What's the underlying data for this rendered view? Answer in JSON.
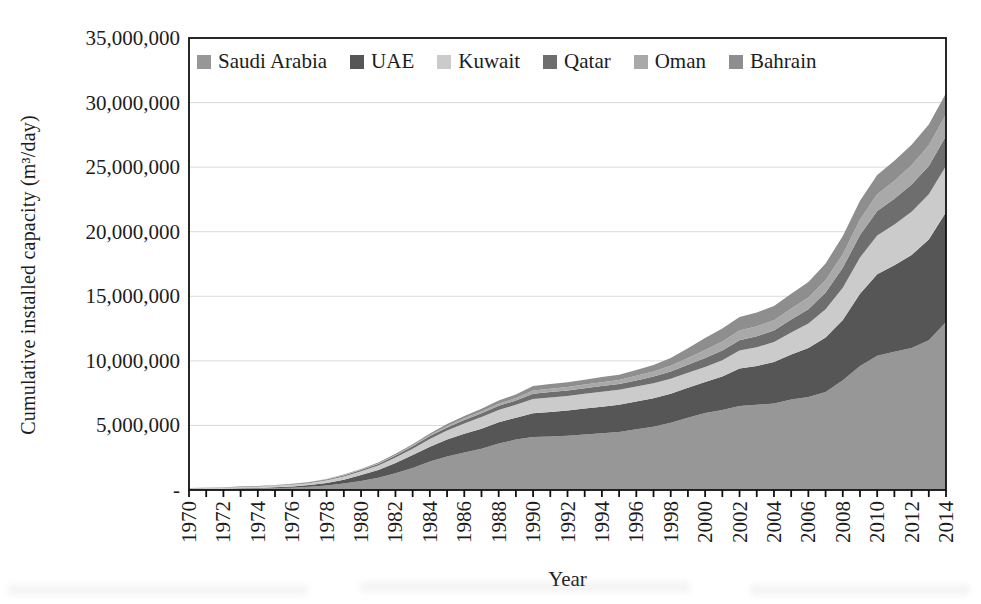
{
  "figure": {
    "y_axis_title": "Cumulative installed capacity (m³/day)",
    "x_axis_title": "Year"
  },
  "chart_data": {
    "type": "area",
    "stacked": true,
    "title": "",
    "xlabel": "Year",
    "ylabel": "Cumulative installed capacity (m³/day)",
    "legend_position": "top-inside-horizontal",
    "grid": "horizontal-only",
    "grid_color": "#dadada",
    "axis_color": "#111111",
    "text_color": "#1c1c1c",
    "ylim": [
      0,
      35000000
    ],
    "y_ticks": [
      {
        "value": 0,
        "label": "-"
      },
      {
        "value": 5000000,
        "label": "5,000,000"
      },
      {
        "value": 10000000,
        "label": "10,000,000"
      },
      {
        "value": 15000000,
        "label": "15,000,000"
      },
      {
        "value": 20000000,
        "label": "20,000,000"
      },
      {
        "value": 25000000,
        "label": "25,000,000"
      },
      {
        "value": 30000000,
        "label": "30,000,000"
      },
      {
        "value": 35000000,
        "label": "35,000,000"
      }
    ],
    "x_range": [
      1970,
      2014
    ],
    "x_minor_tick_every": 1,
    "x_label_every": 2,
    "x": [
      1970,
      1971,
      1972,
      1973,
      1974,
      1975,
      1976,
      1977,
      1978,
      1979,
      1980,
      1981,
      1982,
      1983,
      1984,
      1985,
      1986,
      1987,
      1988,
      1989,
      1990,
      1991,
      1992,
      1993,
      1994,
      1995,
      1996,
      1997,
      1998,
      1999,
      2000,
      2001,
      2002,
      2003,
      2004,
      2005,
      2006,
      2007,
      2008,
      2009,
      2010,
      2011,
      2012,
      2013,
      2014
    ],
    "series": [
      {
        "name": "Saudi Arabia",
        "color": "#979797",
        "values": [
          50000,
          60000,
          80000,
          100000,
          120000,
          150000,
          180000,
          250000,
          350000,
          500000,
          700000,
          950000,
          1300000,
          1700000,
          2200000,
          2600000,
          2900000,
          3200000,
          3600000,
          3900000,
          4100000,
          4150000,
          4200000,
          4300000,
          4400000,
          4500000,
          4700000,
          4900000,
          5200000,
          5600000,
          5960000,
          6200000,
          6500000,
          6600000,
          6700000,
          7000000,
          7200000,
          7600000,
          8500000,
          9600000,
          10400000,
          10700000,
          11000000,
          11600000,
          13000000
        ]
      },
      {
        "name": "UAE",
        "color": "#565656",
        "values": [
          10000,
          10000,
          20000,
          30000,
          40000,
          60000,
          90000,
          130000,
          200000,
          300000,
          450000,
          600000,
          800000,
          1000000,
          1150000,
          1300000,
          1450000,
          1550000,
          1650000,
          1700000,
          1850000,
          1900000,
          1950000,
          2000000,
          2050000,
          2100000,
          2150000,
          2200000,
          2250000,
          2320000,
          2400000,
          2600000,
          2900000,
          3000000,
          3200000,
          3500000,
          3800000,
          4200000,
          4660000,
          5600000,
          6300000,
          6700000,
          7200000,
          7800000,
          8500000
        ]
      },
      {
        "name": "Kuwait",
        "color": "#cbcbcb",
        "values": [
          80000,
          90000,
          100000,
          110000,
          120000,
          130000,
          150000,
          170000,
          200000,
          250000,
          300000,
          350000,
          420000,
          500000,
          600000,
          700000,
          800000,
          900000,
          950000,
          1000000,
          1100000,
          1120000,
          1140000,
          1150000,
          1160000,
          1160000,
          1160000,
          1160000,
          1160000,
          1160000,
          1160000,
          1250000,
          1400000,
          1450000,
          1550000,
          1700000,
          1900000,
          2200000,
          2500000,
          2800000,
          3000000,
          3150000,
          3350000,
          3500000,
          3600000
        ]
      },
      {
        "name": "Qatar",
        "color": "#6e6e6e",
        "values": [
          10000,
          10000,
          20000,
          20000,
          30000,
          30000,
          40000,
          50000,
          60000,
          80000,
          100000,
          120000,
          150000,
          180000,
          220000,
          250000,
          280000,
          300000,
          320000,
          340000,
          400000,
          410000,
          420000,
          430000,
          440000,
          450000,
          480000,
          520000,
          560000,
          620000,
          700000,
          750000,
          800000,
          850000,
          900000,
          1000000,
          1100000,
          1300000,
          1550000,
          1750000,
          1900000,
          2000000,
          2100000,
          2200000,
          2300000
        ]
      },
      {
        "name": "Oman",
        "color": "#a9a9a9",
        "values": [
          0,
          0,
          0,
          0,
          0,
          10000,
          10000,
          10000,
          20000,
          20000,
          30000,
          40000,
          50000,
          60000,
          80000,
          100000,
          120000,
          140000,
          160000,
          180000,
          250000,
          260000,
          270000,
          280000,
          290000,
          300000,
          350000,
          400000,
          450000,
          520000,
          620000,
          700000,
          750000,
          780000,
          800000,
          850000,
          900000,
          950000,
          1050000,
          1200000,
          1300000,
          1400000,
          1500000,
          1600000,
          1700000
        ]
      },
      {
        "name": "Bahrain",
        "color": "#8e8e8e",
        "values": [
          0,
          0,
          0,
          10000,
          10000,
          10000,
          20000,
          20000,
          30000,
          40000,
          50000,
          60000,
          80000,
          100000,
          120000,
          150000,
          170000,
          200000,
          250000,
          280000,
          350000,
          360000,
          370000,
          380000,
          400000,
          420000,
          450000,
          500000,
          600000,
          750000,
          930000,
          1000000,
          1050000,
          1070000,
          1100000,
          1150000,
          1200000,
          1300000,
          1400000,
          1450000,
          1500000,
          1550000,
          1580000,
          1600000,
          1620000
        ]
      }
    ]
  }
}
